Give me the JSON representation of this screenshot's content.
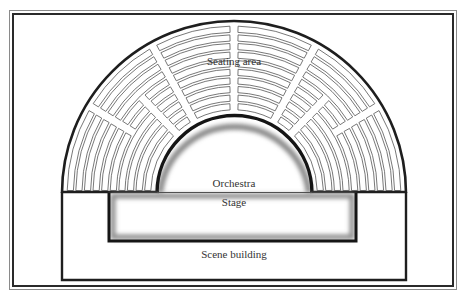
{
  "diagram": {
    "labels": {
      "seating": "Seating area",
      "orchestra": "Orchestra",
      "stage": "Stage",
      "scene": "Scene building"
    },
    "colors": {
      "line": "#1e1e1e",
      "seat_outline": "#555555",
      "shadow": "#9a9a9a",
      "background": "#ffffff"
    }
  }
}
